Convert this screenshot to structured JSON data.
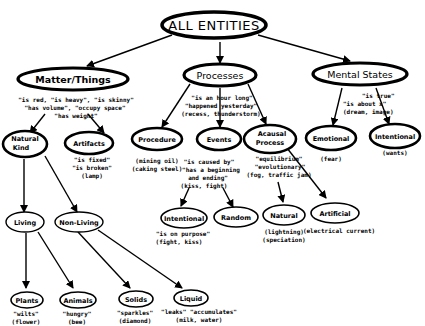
{
  "title": "ALL ENTITIES",
  "nodes": {
    "root": {
      "label": "ALL ENTITIES"
    },
    "matter": {
      "label": "Matter/Things"
    },
    "processes": {
      "label": "Processes"
    },
    "mental": {
      "label": "Mental States"
    },
    "natural_kind": {
      "label1": "Natural",
      "label2": "Kind"
    },
    "artifacts": {
      "label": "Artifacts"
    },
    "procedure": {
      "label": "Procedure"
    },
    "events": {
      "label": "Events"
    },
    "acausal": {
      "label1": "Acausal",
      "label2": "Process"
    },
    "emotional": {
      "label": "Emotional"
    },
    "intentional_mental": {
      "label": "Intentional"
    },
    "living": {
      "label": "Living"
    },
    "non_living": {
      "label": "Non-Living"
    },
    "intentional_event": {
      "label": "Intentional"
    },
    "random": {
      "label": "Random"
    },
    "natural_process": {
      "label": "Natural"
    },
    "artificial": {
      "label": "Artificial"
    },
    "plants": {
      "label": "Plants"
    },
    "animals": {
      "label": "Animals"
    },
    "solids": {
      "label": "Solids"
    },
    "liquid": {
      "label": "Liquid"
    }
  },
  "annotations": {
    "matter": [
      "\"is red, \"is heavy\", \"is skinny\"",
      "\"has volume\", \"occupy space\"",
      "\"has weight\""
    ],
    "processes": [
      "\"is an hour long\"",
      "\"happened yesterday\"",
      "(recess, thunderstorm)"
    ],
    "mental": [
      "\"is true\"",
      "\"is about x\"",
      "(dream, image)"
    ],
    "artifacts": [
      "\"is fixed\"",
      "\"is broken\"",
      "(lamp)"
    ],
    "procedure": [
      "(mining oil)",
      "(caking steel)"
    ],
    "events": [
      "\"is caused by\"",
      "\"has a beginning",
      "and ending\"",
      "(kiss, fight)"
    ],
    "acausal": [
      "\"equilibrium\"",
      "\"evolutionary\"",
      "(fog, traffic jam)"
    ],
    "emotional": [
      "(fear)"
    ],
    "intentional_mental": [
      "(wants)"
    ],
    "intentional_event": [
      "\"is on purpose\"",
      "(fight, kiss)"
    ],
    "natural_process": [
      "(lightning)",
      "(speciation)"
    ],
    "artificial": [
      "(electrical current)"
    ],
    "plants": [
      "\"wilts\"",
      "(flower)"
    ],
    "animals": [
      "\"hungry\"",
      "(bee)"
    ],
    "solids": [
      "\"sparkles\"",
      "(diamond)"
    ],
    "liquid": [
      "\"leaks\" \"accumulates\"",
      "(milk, water)"
    ]
  }
}
